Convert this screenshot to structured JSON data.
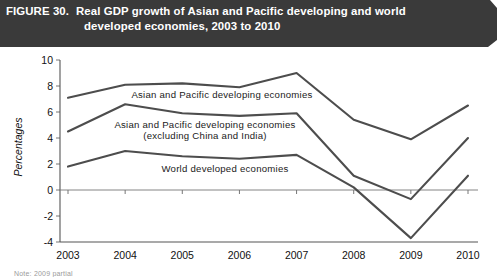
{
  "banner": {
    "figure_label": "FIGURE 30.",
    "title_line_1": "Real GDP growth of Asian and Pacific developing and world",
    "title_line_2": "developed economies, 2003 to 2010"
  },
  "footnote": "Note: 2009 partial",
  "chart_data": {
    "type": "line",
    "title": "Real GDP growth of Asian and Pacific developing and world developed economies, 2003 to 2010",
    "xlabel": "",
    "ylabel": "Percentages",
    "categories": [
      "2003",
      "2004",
      "2005",
      "2006",
      "2007",
      "2008",
      "2009",
      "2010"
    ],
    "ylim": [
      -4,
      10
    ],
    "y_ticks": [
      "10",
      "8",
      "6",
      "4",
      "2",
      "0",
      "-2",
      "-4"
    ],
    "y_tick_values": [
      10,
      8,
      6,
      4,
      2,
      0,
      -2,
      -4
    ],
    "grid": false,
    "legend": "inline-labels",
    "series": [
      {
        "name": "Asian and Pacific developing economies",
        "label_line_1": "Asian and Pacific developing economies",
        "label_line_2": "",
        "values": [
          7.1,
          8.1,
          8.2,
          7.9,
          9.0,
          5.4,
          3.9,
          6.5
        ]
      },
      {
        "name": "Asian and Pacific developing economies (excluding China and India)",
        "label_line_1": "Asian and Pacific developing economies",
        "label_line_2": "(excluding China and India)",
        "values": [
          4.5,
          6.6,
          5.9,
          5.7,
          5.9,
          1.1,
          -0.7,
          4.0
        ]
      },
      {
        "name": "World developed economies",
        "label_line_1": "World developed economies",
        "label_line_2": "",
        "values": [
          1.8,
          3.0,
          2.6,
          2.4,
          2.7,
          0.2,
          -3.7,
          1.1
        ]
      }
    ]
  }
}
